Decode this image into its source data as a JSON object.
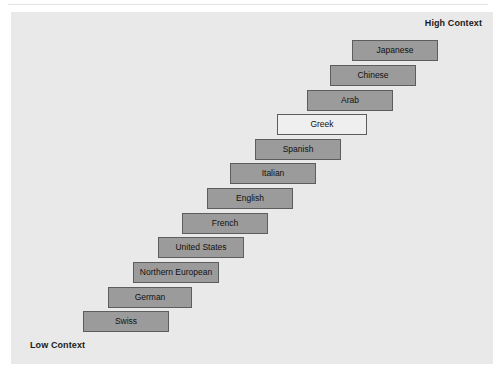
{
  "figure": {
    "title_visible": false,
    "axis_labels": {
      "high": "High Context",
      "low": "Low Context"
    },
    "colors": {
      "panel_background": "#e9e9e9",
      "box_fill": "#9b9b9b",
      "box_fill_highlight": "#efefef",
      "box_border": "#5d5d5d",
      "text": "#111111",
      "page_background": "#ffffff"
    }
  },
  "chart_data": {
    "type": "bar",
    "title": "",
    "subtitle": "",
    "xlabel": "",
    "ylabel": "",
    "orientation": "horizontal-staircase",
    "grid": false,
    "legend": false,
    "annotations": [
      "High Context",
      "Low Context"
    ],
    "categories": [
      "Japanese",
      "Chinese",
      "Arab",
      "Greek",
      "Spanish",
      "Italian",
      "English",
      "French",
      "United States",
      "Northern European",
      "German",
      "Swiss"
    ],
    "values": [
      12,
      11,
      10,
      9,
      8,
      7,
      6,
      5,
      4,
      3,
      2,
      1
    ],
    "items": [
      {
        "label": "Japanese",
        "rank": 12,
        "left": 341,
        "top": 28,
        "width": 86,
        "style": "filled"
      },
      {
        "label": "Chinese",
        "rank": 11,
        "left": 319,
        "top": 53,
        "width": 86,
        "style": "filled"
      },
      {
        "label": "Arab",
        "rank": 10,
        "left": 296,
        "top": 78,
        "width": 86,
        "style": "filled"
      },
      {
        "label": "Greek",
        "rank": 9,
        "left": 266,
        "top": 102,
        "width": 90,
        "style": "hollow"
      },
      {
        "label": "Spanish",
        "rank": 8,
        "left": 244,
        "top": 127,
        "width": 86,
        "style": "filled"
      },
      {
        "label": "Italian",
        "rank": 7,
        "left": 219,
        "top": 151,
        "width": 86,
        "style": "filled"
      },
      {
        "label": "English",
        "rank": 6,
        "left": 196,
        "top": 176,
        "width": 86,
        "style": "filled"
      },
      {
        "label": "French",
        "rank": 5,
        "left": 171,
        "top": 201,
        "width": 86,
        "style": "filled"
      },
      {
        "label": "United States",
        "rank": 4,
        "left": 147,
        "top": 225,
        "width": 86,
        "style": "filled"
      },
      {
        "label": "Northern European",
        "rank": 3,
        "left": 122,
        "top": 250,
        "width": 86,
        "style": "filled"
      },
      {
        "label": "German",
        "rank": 2,
        "left": 97,
        "top": 275,
        "width": 84,
        "style": "filled"
      },
      {
        "label": "Swiss",
        "rank": 1,
        "left": 72,
        "top": 299,
        "width": 86,
        "style": "filled"
      }
    ]
  }
}
